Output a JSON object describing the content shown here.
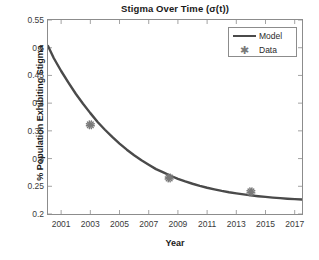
{
  "chart_data": {
    "type": "line",
    "title": "Stigma Over Time (σ(t))",
    "xlabel": "Year",
    "ylabel": "% Population Exhibiting Stigma",
    "xlim": [
      2000.1,
      2017.5
    ],
    "ylim": [
      0.2,
      0.55
    ],
    "xticks": [
      2001,
      2003,
      2005,
      2007,
      2009,
      2011,
      2013,
      2015,
      2017
    ],
    "xtick_labels": [
      "2001",
      "2003",
      "2005",
      "2007",
      "2009",
      "2011",
      "2013",
      "2015",
      "2017"
    ],
    "yticks": [
      0.2,
      0.25,
      0.3,
      0.35,
      0.4,
      0.45,
      0.5,
      0.55
    ],
    "ytick_labels": [
      "0.2",
      "0.25",
      "0.3",
      "0.35",
      "0.4",
      "0.45",
      "0.5",
      "0.55"
    ],
    "grid": false,
    "legend_position": "top-right",
    "series": [
      {
        "name": "Model",
        "kind": "line",
        "color": "#4a4a4a",
        "linewidth": 2.4,
        "x": [
          2000.1,
          2000.5,
          2001.0,
          2001.5,
          2002.0,
          2002.5,
          2003.0,
          2003.5,
          2004.0,
          2004.5,
          2005.0,
          2005.5,
          2006.0,
          2006.5,
          2007.0,
          2007.5,
          2008.0,
          2008.5,
          2009.0,
          2009.5,
          2010.0,
          2010.5,
          2011.0,
          2011.5,
          2012.0,
          2012.5,
          2013.0,
          2013.5,
          2014.0,
          2014.5,
          2015.0,
          2015.5,
          2016.0,
          2016.5,
          2017.0,
          2017.5
        ],
        "y": [
          0.503,
          0.481,
          0.458,
          0.437,
          0.417,
          0.399,
          0.382,
          0.366,
          0.352,
          0.339,
          0.327,
          0.316,
          0.306,
          0.297,
          0.289,
          0.281,
          0.275,
          0.269,
          0.2635,
          0.2588,
          0.2546,
          0.2508,
          0.2474,
          0.2444,
          0.2417,
          0.2393,
          0.2372,
          0.2353,
          0.2336,
          0.2321,
          0.2308,
          0.2296,
          0.2286,
          0.2276,
          0.2268,
          0.2261
        ]
      },
      {
        "name": "Data",
        "kind": "scatter",
        "marker": "asterisk",
        "color": "#7a7a7a",
        "x": [
          2003.0,
          2008.4,
          2014.0
        ],
        "y": [
          0.361,
          0.265,
          0.24
        ]
      }
    ]
  },
  "legend": {
    "model_label": "Model",
    "data_label": "Data"
  },
  "colors": {
    "line": "#4a4a4a",
    "marker": "#7a7a7a",
    "axis": "#8c8c8c",
    "background": "#ffffff",
    "text": "#1a1a1a"
  }
}
